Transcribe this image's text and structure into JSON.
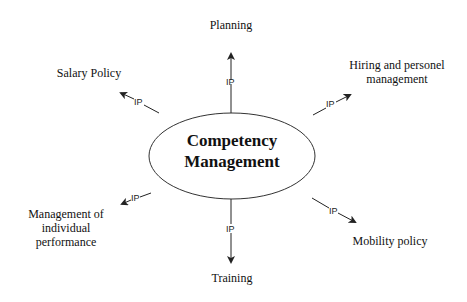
{
  "center": {
    "line1": "Competency",
    "line2": "Management"
  },
  "link_label": "IP",
  "nodes": {
    "planning": {
      "label": "Planning"
    },
    "hiring": {
      "line1": "Hiring and personel",
      "line2": "management"
    },
    "salary": {
      "label": "Salary Policy"
    },
    "individual": {
      "line1": "Management of",
      "line2": "individual",
      "line3": "performance"
    },
    "mobility": {
      "label": "Mobility policy"
    },
    "training": {
      "label": "Training"
    }
  },
  "colors": {
    "stroke": "#222222",
    "text": "#111111",
    "background": "#ffffff"
  }
}
